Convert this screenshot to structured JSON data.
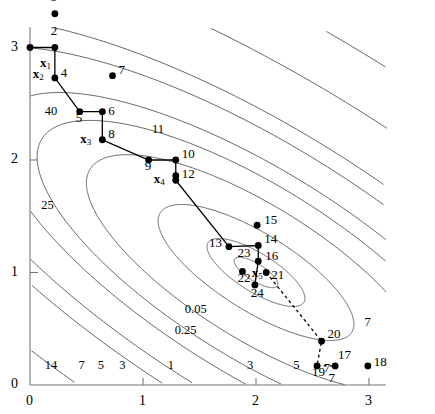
{
  "figure": {
    "type": "contour-plot-with-trajectory",
    "background": "#ffffff",
    "line_color": "#555555",
    "marker_color": "#000000",
    "path_color": "#000000"
  },
  "axes": {
    "x": {
      "ticks": [
        0,
        1,
        2,
        3
      ],
      "min": 0,
      "max": 3.15,
      "label": ""
    },
    "y": {
      "ticks": [
        0,
        1,
        2,
        3
      ],
      "min": 0,
      "max": 3.15,
      "label": ""
    }
  },
  "chart_data": {
    "type": "line",
    "title": "",
    "xlabel": "",
    "ylabel": "",
    "xlim": [
      0,
      3.15
    ],
    "ylim": [
      0,
      3.15
    ],
    "grid": false,
    "legend": "none",
    "contour_levels": [
      0.05,
      0.25,
      1,
      3,
      5,
      7,
      11,
      14,
      25,
      40
    ],
    "contour_labels": [
      {
        "text": "40",
        "x": 0.13,
        "y": 2.42
      },
      {
        "text": "25",
        "x": 0.1,
        "y": 1.58
      },
      {
        "text": "14",
        "x": 0.13,
        "y": 0.16
      },
      {
        "text": "7",
        "x": 0.43,
        "y": 0.16
      },
      {
        "text": "5",
        "x": 0.6,
        "y": 0.16
      },
      {
        "text": "3",
        "x": 0.79,
        "y": 0.16
      },
      {
        "text": "1",
        "x": 1.22,
        "y": 0.16
      },
      {
        "text": "3",
        "x": 1.92,
        "y": 0.16
      },
      {
        "text": "5",
        "x": 2.33,
        "y": 0.16
      },
      {
        "text": "7",
        "x": 2.6,
        "y": 0.13
      },
      {
        "text": "7",
        "x": 2.96,
        "y": 0.54
      },
      {
        "text": "11",
        "x": 1.08,
        "y": 2.26
      },
      {
        "text": "0.05",
        "x": 1.37,
        "y": 0.66
      },
      {
        "text": "0.25",
        "x": 1.28,
        "y": 0.47
      }
    ],
    "series": [
      {
        "name": "iterates",
        "points": [
          {
            "id": "1",
            "label": "1",
            "x": 0.0,
            "y": 3.0,
            "label_dx": 0,
            "label_dy": 0,
            "show_label": false
          },
          {
            "id": "2",
            "label": "2",
            "x": 0.22,
            "y": 3.0,
            "label_dx": -4,
            "label_dy": -17
          },
          {
            "id": "3",
            "label": "3",
            "x": 0.22,
            "y": 3.3,
            "label_dx": -4,
            "label_dy": -17
          },
          {
            "id": "4",
            "label": "4",
            "x": 0.22,
            "y": 2.73,
            "label_dx": 6,
            "label_dy": -5
          },
          {
            "id": "5",
            "label": "5",
            "x": 0.44,
            "y": 2.43,
            "label_dx": -4,
            "label_dy": 6
          },
          {
            "id": "6",
            "label": "6",
            "x": 0.64,
            "y": 2.43,
            "label_dx": 6,
            "label_dy": -1
          },
          {
            "id": "7",
            "label": "7",
            "x": 0.73,
            "y": 2.75,
            "label_dx": 6,
            "label_dy": -6
          },
          {
            "id": "8",
            "label": "8",
            "x": 0.64,
            "y": 2.18,
            "label_dx": 6,
            "label_dy": -6
          },
          {
            "id": "9",
            "label": "9",
            "x": 1.05,
            "y": 2.0,
            "label_dx": -4,
            "label_dy": 6
          },
          {
            "id": "10",
            "label": "10",
            "x": 1.29,
            "y": 2.0,
            "label_dx": 6,
            "label_dy": -6
          },
          {
            "id": "11",
            "label": "11",
            "x": 1.29,
            "y": 1.86,
            "label_dx": 6,
            "label_dy": -5,
            "show_label": false
          },
          {
            "id": "12",
            "label": "12",
            "x": 1.29,
            "y": 1.82,
            "label_dx": 6,
            "label_dy": -6
          },
          {
            "id": "13",
            "label": "13",
            "x": 1.76,
            "y": 1.23,
            "label_dx": -20,
            "label_dy": -4
          },
          {
            "id": "14",
            "label": "14",
            "x": 2.02,
            "y": 1.24,
            "label_dx": 6,
            "label_dy": -7
          },
          {
            "id": "15",
            "label": "15",
            "x": 2.01,
            "y": 1.42,
            "label_dx": 7,
            "label_dy": -5
          },
          {
            "id": "16",
            "label": "16",
            "x": 2.02,
            "y": 1.1,
            "label_dx": 7,
            "label_dy": -5
          },
          {
            "id": "17",
            "label": "17",
            "x": 2.7,
            "y": 0.17,
            "label_dx": 3,
            "label_dy": -11
          },
          {
            "id": "18",
            "label": "18",
            "x": 2.99,
            "y": 0.17,
            "label_dx": 6,
            "label_dy": -4
          },
          {
            "id": "19",
            "label": "19",
            "x": 2.54,
            "y": 0.17,
            "label_dx": -5,
            "label_dy": 6
          },
          {
            "id": "20",
            "label": "20",
            "x": 2.58,
            "y": 0.39,
            "label_dx": 6,
            "label_dy": -7
          },
          {
            "id": "21",
            "label": "21",
            "x": 2.09,
            "y": 1.0,
            "label_dx": 5,
            "label_dy": 2
          },
          {
            "id": "22",
            "label": "22",
            "x": 1.88,
            "y": 1.01,
            "label_dx": -5,
            "label_dy": 7
          },
          {
            "id": "23",
            "label": "23",
            "x": 1.96,
            "y": 1.16,
            "label_dx": -14,
            "label_dy": -2,
            "show_marker": false
          },
          {
            "id": "24",
            "label": "24",
            "x": 1.99,
            "y": 0.89,
            "label_dx": -4,
            "label_dy": 8
          },
          {
            "id": "7b",
            "label": "7",
            "x": 2.66,
            "y": 0.12,
            "label_dx": -2,
            "label_dy": 6,
            "show_marker": false
          }
        ]
      }
    ],
    "vertex_labels": [
      {
        "text": "x",
        "sub": "1",
        "x": 0.07,
        "y": 2.9,
        "dx": 2,
        "dy": 4
      },
      {
        "text": "x",
        "sub": "2",
        "x": 0.22,
        "y": 2.73,
        "dx": -22,
        "dy": -4
      },
      {
        "text": "x",
        "sub": "3",
        "x": 0.64,
        "y": 2.18,
        "dx": -22,
        "dy": -1
      },
      {
        "text": "x",
        "sub": "4",
        "x": 1.29,
        "y": 1.82,
        "dx": -22,
        "dy": -1
      },
      {
        "text": "x",
        "sub": "5",
        "x": 1.99,
        "y": 1.01,
        "dx": -3,
        "dy": 2
      }
    ],
    "solid_path": [
      [
        0.0,
        3.0
      ],
      [
        0.22,
        3.0
      ],
      [
        0.22,
        2.73
      ],
      [
        0.44,
        2.43
      ],
      [
        0.64,
        2.43
      ],
      [
        0.64,
        2.18
      ],
      [
        1.05,
        2.0
      ],
      [
        1.29,
        2.0
      ],
      [
        1.29,
        1.82
      ],
      [
        1.76,
        1.23
      ],
      [
        2.02,
        1.24
      ],
      [
        2.02,
        1.1
      ],
      [
        1.99,
        0.89
      ]
    ],
    "dashed_path": [
      [
        2.09,
        1.0
      ],
      [
        2.58,
        0.39
      ],
      [
        2.54,
        0.17
      ],
      [
        2.7,
        0.17
      ]
    ]
  }
}
